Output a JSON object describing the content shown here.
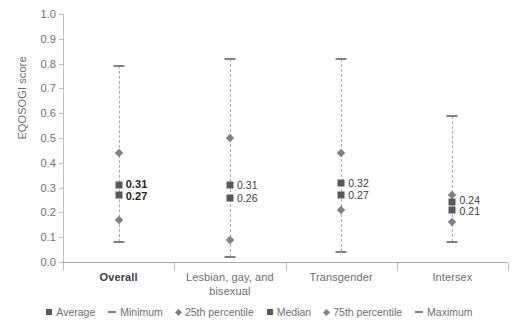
{
  "chart_data": {
    "type": "scatter",
    "title": "",
    "xlabel": "",
    "ylabel": "EQOSOGI score",
    "ylim": [
      0.0,
      1.0
    ],
    "grid": false,
    "legend_position": "bottom",
    "ytick_labels": [
      "1.0",
      "0.9",
      "0.8",
      "0.7",
      "0.6",
      "0.5",
      "0.4",
      "0.3",
      "0.2",
      "0.1",
      "0.0"
    ],
    "ytick_values": [
      1.0,
      0.9,
      0.8,
      0.7,
      0.6,
      0.5,
      0.4,
      0.3,
      0.2,
      0.1,
      0.0
    ],
    "categories": [
      "Overall",
      "Lesbian, gay, and bisexual",
      "Transgender",
      "Intersex"
    ],
    "series": [
      {
        "name": "Average",
        "marker": "square",
        "values": [
          0.31,
          0.31,
          0.32,
          0.24
        ]
      },
      {
        "name": "Minimum",
        "marker": "dash",
        "values": [
          0.08,
          0.02,
          0.04,
          0.08
        ]
      },
      {
        "name": "25th percentile",
        "marker": "diamond",
        "values": [
          0.17,
          0.09,
          0.21,
          0.16
        ]
      },
      {
        "name": "Median",
        "marker": "square",
        "values": [
          0.27,
          0.26,
          0.27,
          0.21
        ]
      },
      {
        "name": "75th percentile",
        "marker": "diamond",
        "values": [
          0.44,
          0.5,
          0.44,
          0.27
        ]
      },
      {
        "name": "Maximum",
        "marker": "dash",
        "values": [
          0.79,
          0.82,
          0.82,
          0.59
        ]
      }
    ],
    "point_labels": [
      {
        "category": "Overall",
        "average": "0.31",
        "median": "0.27",
        "bold": true
      },
      {
        "category": "Lesbian, gay, and bisexual",
        "average": "0.31",
        "median": "0.26",
        "bold": false
      },
      {
        "category": "Transgender",
        "average": "0.32",
        "median": "0.27",
        "bold": false
      },
      {
        "category": "Intersex",
        "average": "0.24",
        "median": "0.21",
        "bold": false
      }
    ]
  },
  "axis": {
    "y_label": "EQOSOGI score",
    "ticks": [
      {
        "label": "1.0"
      },
      {
        "label": "0.9"
      },
      {
        "label": "0.8"
      },
      {
        "label": "0.7"
      },
      {
        "label": "0.6"
      },
      {
        "label": "0.5"
      },
      {
        "label": "0.4"
      },
      {
        "label": "0.3"
      },
      {
        "label": "0.2"
      },
      {
        "label": "0.1"
      },
      {
        "label": "0.0"
      }
    ]
  },
  "categories": [
    {
      "label": "Overall",
      "line1": "Overall",
      "line2": "",
      "bold": true
    },
    {
      "label": "Lesbian, gay, and bisexual",
      "line1": "Lesbian, gay, and",
      "line2": "bisexual",
      "bold": false
    },
    {
      "label": "Transgender",
      "line1": "Transgender",
      "line2": "",
      "bold": false
    },
    {
      "label": "Intersex",
      "line1": "Intersex",
      "line2": "",
      "bold": false
    }
  ],
  "legend": {
    "items": [
      {
        "label": "Average",
        "marker": "square"
      },
      {
        "label": "Minimum",
        "marker": "dash"
      },
      {
        "label": "25th percentile",
        "marker": "diamond"
      },
      {
        "label": "Median",
        "marker": "square"
      },
      {
        "label": "75th percentile",
        "marker": "diamond"
      },
      {
        "label": "Maximum",
        "marker": "dash"
      }
    ]
  },
  "colors": {
    "square": "#58595b",
    "diamond": "#808285",
    "dash": "#808285",
    "axis": "#bcbec0",
    "text": "#6d6e71"
  }
}
